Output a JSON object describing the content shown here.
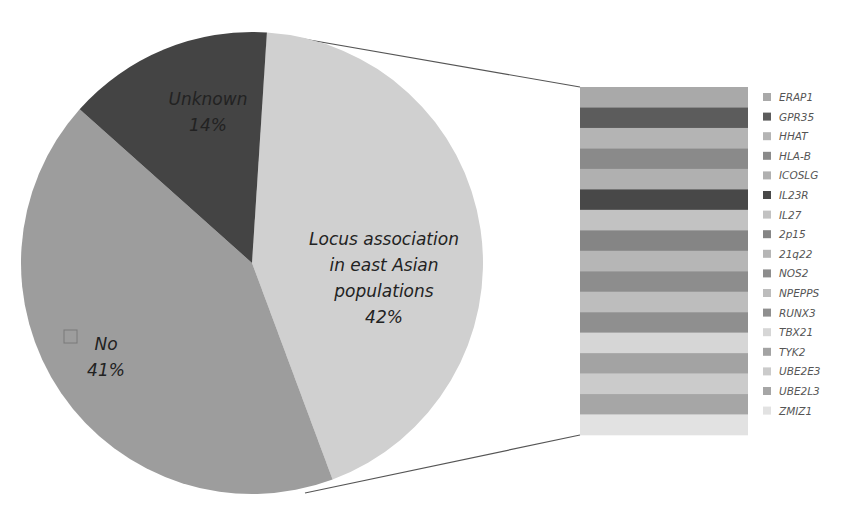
{
  "chart_data": {
    "type": "pie",
    "subtype": "bar-of-pie",
    "title": "",
    "pie": {
      "slices": [
        {
          "label": "Locus association in east Asian populations",
          "label_lines": [
            "Locus association",
            "in east Asian",
            "populations"
          ],
          "value": 42,
          "display": "42%",
          "color": "#d0d0d0"
        },
        {
          "label": "No",
          "label_lines": [
            "No"
          ],
          "value": 41,
          "display": "41%",
          "color": "#9d9d9d"
        },
        {
          "label": "Unknown",
          "label_lines": [
            "Unknown"
          ],
          "value": 14,
          "display": "14%",
          "color": "#444444"
        }
      ]
    },
    "breakdown_bar": {
      "parent_slice": "Locus association in east Asian populations",
      "segments": [
        {
          "label": "ERAP1",
          "value": 1,
          "color": "#a9a9a9"
        },
        {
          "label": "GPR35",
          "value": 1,
          "color": "#5c5c5c"
        },
        {
          "label": "HHAT",
          "value": 1,
          "color": "#b4b4b4"
        },
        {
          "label": "HLA-B",
          "value": 1,
          "color": "#8a8a8a"
        },
        {
          "label": "ICOSLG",
          "value": 1,
          "color": "#b0b0b0"
        },
        {
          "label": "IL23R",
          "value": 1,
          "color": "#484848"
        },
        {
          "label": "IL27",
          "value": 1,
          "color": "#c2c2c2"
        },
        {
          "label": "2p15",
          "value": 1,
          "color": "#858585"
        },
        {
          "label": "21q22",
          "value": 1,
          "color": "#b6b6b6"
        },
        {
          "label": "NOS2",
          "value": 1,
          "color": "#8d8d8d"
        },
        {
          "label": "NPEPPS",
          "value": 1,
          "color": "#bdbdbd"
        },
        {
          "label": "RUNX3",
          "value": 1,
          "color": "#8f8f8f"
        },
        {
          "label": "TBX21",
          "value": 1,
          "color": "#d6d6d6"
        },
        {
          "label": "TYK2",
          "value": 1,
          "color": "#a3a3a3"
        },
        {
          "label": "UBE2E3",
          "value": 1,
          "color": "#cbcbcb"
        },
        {
          "label": "UBE2L3",
          "value": 1,
          "color": "#a6a6a6"
        },
        {
          "label": "ZMIZ1",
          "value": 1,
          "color": "#e2e2e2"
        }
      ]
    },
    "legend": {
      "position": "right",
      "entries": [
        "ERAP1",
        "GPR35",
        "HHAT",
        "HLA-B",
        "ICOSLG",
        "IL23R",
        "IL27",
        "2p15",
        "21q22",
        "NOS2",
        "NPEPPS",
        "RUNX3",
        "TBX21",
        "TYK2",
        "UBE2E3",
        "UBE2L3",
        "ZMIZ1"
      ]
    }
  }
}
